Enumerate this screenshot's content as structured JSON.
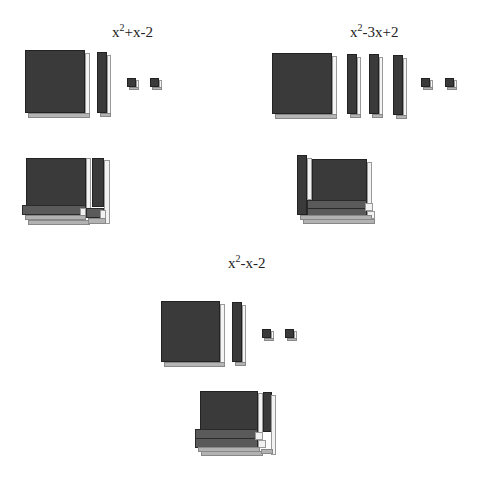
{
  "groups": [
    {
      "id": "top-left",
      "expression": {
        "base": "x",
        "exp": "2",
        "rest": "+x-2"
      },
      "pieces": {
        "x_squared": 1,
        "x_rods": 1,
        "units": 2
      }
    },
    {
      "id": "top-right",
      "expression": {
        "base": "x",
        "exp": "2",
        "rest": "-3x+2"
      },
      "pieces": {
        "x_squared": 1,
        "x_rods": 3,
        "units": 2
      }
    },
    {
      "id": "middle",
      "expression": {
        "base": "x",
        "exp": "2",
        "rest": "-x-2"
      },
      "pieces": {
        "x_squared": 1,
        "x_rods": 1,
        "units": 2
      }
    }
  ],
  "colors": {
    "tile_front": "#3a3a3a",
    "tile_side": "#f4f4f4",
    "tile_bottom": "#b5b5b5",
    "background": "#ffffff"
  }
}
